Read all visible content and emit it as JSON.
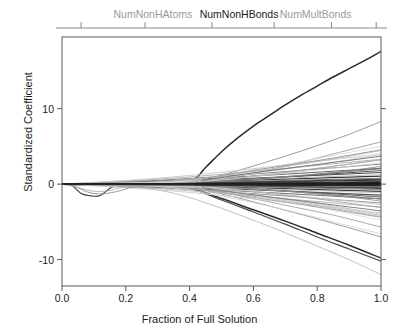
{
  "chart_data": {
    "type": "line",
    "title": "",
    "xlabel": "Fraction of Full Solution",
    "ylabel": "Standardized Coefficient",
    "xlim": [
      0.0,
      1.0
    ],
    "ylim": [
      -13.5,
      19.5
    ],
    "xticks": [
      "0.0",
      "0.2",
      "0.4",
      "0.6",
      "0.8",
      "1.0"
    ],
    "xtick_values": [
      0.0,
      0.2,
      0.4,
      0.6,
      0.8,
      1.0
    ],
    "yticks": [
      "10",
      "0",
      "-10"
    ],
    "ytick_values": [
      10,
      0,
      -10
    ],
    "grid": false,
    "legend": "none",
    "top_axis_labels": [
      {
        "text": "NumNonHAtoms",
        "x": 0.285,
        "emphasis": "grey"
      },
      {
        "text": "NumNonHBonds",
        "x": 0.555,
        "emphasis": "black"
      },
      {
        "text": "NumMultBonds",
        "x": 0.795,
        "emphasis": "grey"
      }
    ],
    "top_axis_tick_values": [
      0.06,
      0.26,
      0.47,
      0.665,
      0.845,
      0.985
    ],
    "series": [
      {
        "name": "rise-major",
        "shade": "#2b2b2b",
        "width": 1.5,
        "x": [
          0.0,
          0.1,
          0.2,
          0.3,
          0.4,
          0.45,
          0.5,
          0.55,
          0.6,
          0.65,
          0.7,
          0.75,
          0.8,
          0.85,
          0.9,
          0.95,
          1.0
        ],
        "y": [
          0.0,
          0.05,
          0.1,
          0.15,
          0.2,
          2.2,
          4.3,
          6.1,
          7.7,
          9.1,
          10.5,
          11.8,
          13.0,
          14.2,
          15.3,
          16.4,
          17.6
        ]
      },
      {
        "name": "fall-major",
        "shade": "#2b2b2b",
        "width": 1.5,
        "x": [
          0.0,
          0.1,
          0.2,
          0.3,
          0.4,
          0.5,
          0.6,
          0.7,
          0.8,
          0.9,
          1.0
        ],
        "y": [
          0.0,
          -0.1,
          -0.2,
          -0.3,
          -0.5,
          -1.9,
          -3.4,
          -4.9,
          -6.5,
          -8.1,
          -9.8
        ]
      },
      {
        "name": "fall-second",
        "shade": "#4a4a4a",
        "width": 1.2,
        "x": [
          0.0,
          0.15,
          0.3,
          0.4,
          0.5,
          0.6,
          0.7,
          0.8,
          0.9,
          1.0
        ],
        "y": [
          0.0,
          -0.2,
          -0.4,
          -0.6,
          -2.1,
          -3.7,
          -5.3,
          -7.0,
          -8.6,
          -10.2
        ]
      },
      {
        "name": "dip-line",
        "shade": "#3a3a3a",
        "width": 1.1,
        "x": [
          0.0,
          0.03,
          0.06,
          0.09,
          0.12,
          0.16,
          0.22,
          0.35,
          0.5,
          0.7,
          0.85,
          1.0
        ],
        "y": [
          0.0,
          -0.15,
          -1.25,
          -1.55,
          -1.5,
          -0.35,
          -0.1,
          0.05,
          0.15,
          0.25,
          0.3,
          0.35
        ]
      },
      {
        "name": "rise-mid-a",
        "shade": "#9e9e9e",
        "width": 1.0,
        "x": [
          0.0,
          0.2,
          0.4,
          0.5,
          0.6,
          0.7,
          0.8,
          0.9,
          1.0
        ],
        "y": [
          0.0,
          0.1,
          0.3,
          1.2,
          2.4,
          3.7,
          5.1,
          6.6,
          8.3
        ]
      },
      {
        "name": "rise-mid-b",
        "shade": "#a8a8a8",
        "width": 1.0,
        "x": [
          0.0,
          0.25,
          0.45,
          0.55,
          0.65,
          0.75,
          0.85,
          1.0
        ],
        "y": [
          0.0,
          0.1,
          0.4,
          1.0,
          1.9,
          2.9,
          4.0,
          5.6
        ]
      },
      {
        "name": "rise-small-a",
        "shade": "#b4b4b4",
        "width": 0.9,
        "x": [
          0.0,
          0.3,
          0.5,
          0.65,
          0.8,
          1.0
        ],
        "y": [
          0.0,
          0.15,
          0.6,
          1.3,
          2.1,
          3.2
        ]
      },
      {
        "name": "fall-mid-a",
        "shade": "#9e9e9e",
        "width": 1.0,
        "x": [
          0.0,
          0.2,
          0.38,
          0.5,
          0.65,
          0.8,
          1.0
        ],
        "y": [
          0.0,
          -0.1,
          -0.4,
          -1.3,
          -2.9,
          -4.6,
          -7.0
        ]
      },
      {
        "name": "fall-mid-b",
        "shade": "#ababab",
        "width": 1.0,
        "x": [
          0.0,
          0.25,
          0.42,
          0.55,
          0.7,
          0.85,
          1.0
        ],
        "y": [
          0.0,
          -0.1,
          -0.5,
          -1.5,
          -2.8,
          -4.1,
          -5.7
        ]
      },
      {
        "name": "fall-small-a",
        "shade": "#bcbcbc",
        "width": 0.9,
        "x": [
          0.0,
          0.3,
          0.5,
          0.7,
          0.85,
          1.0
        ],
        "y": [
          0.0,
          -0.2,
          -0.9,
          -2.0,
          -2.9,
          -4.0
        ]
      },
      {
        "name": "fall-steep-grey",
        "shade": "#c2c2c2",
        "width": 1.0,
        "x": [
          0.0,
          0.2,
          0.35,
          0.5,
          0.65,
          0.8,
          0.92,
          1.0
        ],
        "y": [
          0.0,
          -0.3,
          -1.2,
          -3.2,
          -5.6,
          -8.2,
          -10.4,
          -12.0
        ]
      },
      {
        "name": "band-001",
        "shade": "#1f1f1f",
        "width": 1.4,
        "x": [
          0.0,
          0.4,
          1.0
        ],
        "y": [
          0.0,
          0.15,
          0.55
        ]
      },
      {
        "name": "band-002",
        "shade": "#262626",
        "width": 1.4,
        "x": [
          0.0,
          0.4,
          1.0
        ],
        "y": [
          0.0,
          -0.1,
          -0.45
        ]
      },
      {
        "name": "band-003",
        "shade": "#333333",
        "width": 1.2,
        "x": [
          0.0,
          0.4,
          1.0
        ],
        "y": [
          0.0,
          0.3,
          1.05
        ]
      },
      {
        "name": "band-004",
        "shade": "#3d3d3d",
        "width": 1.2,
        "x": [
          0.0,
          0.4,
          1.0
        ],
        "y": [
          0.0,
          -0.28,
          -0.95
        ]
      },
      {
        "name": "band-005",
        "shade": "#4a4a4a",
        "width": 1.1,
        "x": [
          0.0,
          0.4,
          1.0
        ],
        "y": [
          0.0,
          0.45,
          1.55
        ]
      },
      {
        "name": "band-006",
        "shade": "#555555",
        "width": 1.1,
        "x": [
          0.0,
          0.4,
          1.0
        ],
        "y": [
          0.0,
          -0.42,
          -1.45
        ]
      },
      {
        "name": "band-007",
        "shade": "#606060",
        "width": 1.0,
        "x": [
          0.0,
          0.4,
          1.0
        ],
        "y": [
          0.0,
          0.6,
          2.1
        ]
      },
      {
        "name": "band-008",
        "shade": "#6b6b6b",
        "width": 1.0,
        "x": [
          0.0,
          0.4,
          1.0
        ],
        "y": [
          0.0,
          -0.58,
          -1.95
        ]
      },
      {
        "name": "band-009",
        "shade": "#767676",
        "width": 1.0,
        "x": [
          0.0,
          0.4,
          1.0
        ],
        "y": [
          0.0,
          0.22,
          0.78
        ]
      },
      {
        "name": "band-010",
        "shade": "#808080",
        "width": 1.0,
        "x": [
          0.0,
          0.4,
          1.0
        ],
        "y": [
          0.0,
          -0.2,
          -0.72
        ]
      },
      {
        "name": "band-011",
        "shade": "#8a8a8a",
        "width": 1.0,
        "x": [
          0.0,
          0.4,
          1.0
        ],
        "y": [
          0.0,
          0.75,
          2.65
        ]
      },
      {
        "name": "band-012",
        "shade": "#949494",
        "width": 1.0,
        "x": [
          0.0,
          0.4,
          1.0
        ],
        "y": [
          0.0,
          -0.7,
          -2.5
        ]
      },
      {
        "name": "band-013",
        "shade": "#9e9e9e",
        "width": 0.9,
        "x": [
          0.0,
          0.4,
          1.0
        ],
        "y": [
          0.0,
          0.12,
          0.4
        ]
      },
      {
        "name": "band-014",
        "shade": "#a5a5a5",
        "width": 0.9,
        "x": [
          0.0,
          0.4,
          1.0
        ],
        "y": [
          0.0,
          -0.12,
          -0.38
        ]
      },
      {
        "name": "band-015",
        "shade": "#adadad",
        "width": 0.9,
        "x": [
          0.0,
          0.4,
          1.0
        ],
        "y": [
          0.0,
          0.95,
          3.3
        ]
      },
      {
        "name": "band-016",
        "shade": "#b4b4b4",
        "width": 0.9,
        "x": [
          0.0,
          0.4,
          1.0
        ],
        "y": [
          0.0,
          -0.88,
          -3.05
        ]
      },
      {
        "name": "band-017",
        "shade": "#bababa",
        "width": 0.9,
        "x": [
          0.0,
          0.4,
          1.0
        ],
        "y": [
          0.0,
          0.35,
          1.25
        ]
      },
      {
        "name": "band-018",
        "shade": "#c0c0c0",
        "width": 0.9,
        "x": [
          0.0,
          0.4,
          1.0
        ],
        "y": [
          0.0,
          -0.33,
          -1.15
        ]
      },
      {
        "name": "band-019",
        "shade": "#c6c6c6",
        "width": 0.9,
        "x": [
          0.0,
          0.4,
          1.0
        ],
        "y": [
          0.0,
          1.15,
          4.0
        ]
      },
      {
        "name": "band-020",
        "shade": "#cccccc",
        "width": 0.9,
        "x": [
          0.0,
          0.4,
          1.0
        ],
        "y": [
          0.0,
          -1.1,
          -3.8
        ]
      },
      {
        "name": "band-021",
        "shade": "#555555",
        "width": 1.0,
        "x": [
          0.0,
          0.25,
          0.45,
          0.7,
          1.0
        ],
        "y": [
          0.0,
          0.05,
          0.35,
          0.95,
          1.8
        ]
      },
      {
        "name": "band-022",
        "shade": "#5f5f5f",
        "width": 1.0,
        "x": [
          0.0,
          0.25,
          0.45,
          0.7,
          1.0
        ],
        "y": [
          0.0,
          -0.05,
          -0.32,
          -0.9,
          -1.7
        ]
      },
      {
        "name": "band-023",
        "shade": "#707070",
        "width": 1.0,
        "x": [
          0.0,
          0.3,
          0.55,
          0.8,
          1.0
        ],
        "y": [
          0.0,
          0.1,
          0.55,
          1.3,
          2.05
        ]
      },
      {
        "name": "band-024",
        "shade": "#7b7b7b",
        "width": 1.0,
        "x": [
          0.0,
          0.3,
          0.55,
          0.8,
          1.0
        ],
        "y": [
          0.0,
          -0.1,
          -0.52,
          -1.25,
          -1.98
        ]
      },
      {
        "name": "band-025",
        "shade": "#888888",
        "width": 0.9,
        "x": [
          0.0,
          0.35,
          0.6,
          0.85,
          1.0
        ],
        "y": [
          0.0,
          0.18,
          0.7,
          1.55,
          2.35
        ]
      },
      {
        "name": "band-026",
        "shade": "#939393",
        "width": 0.9,
        "x": [
          0.0,
          0.35,
          0.6,
          0.85,
          1.0
        ],
        "y": [
          0.0,
          -0.17,
          -0.66,
          -1.48,
          -2.25
        ]
      },
      {
        "name": "band-027",
        "shade": "#2e2e2e",
        "width": 1.3,
        "x": [
          0.0,
          0.5,
          1.0
        ],
        "y": [
          0.0,
          0.08,
          0.28
        ]
      },
      {
        "name": "band-028",
        "shade": "#343434",
        "width": 1.3,
        "x": [
          0.0,
          0.5,
          1.0
        ],
        "y": [
          0.0,
          -0.06,
          -0.22
        ]
      },
      {
        "name": "band-029",
        "shade": "#424242",
        "width": 1.2,
        "x": [
          0.0,
          0.5,
          1.0
        ],
        "y": [
          0.0,
          0.18,
          0.62
        ]
      },
      {
        "name": "band-030",
        "shade": "#4d4d4d",
        "width": 1.2,
        "x": [
          0.0,
          0.5,
          1.0
        ],
        "y": [
          0.0,
          -0.16,
          -0.58
        ]
      },
      {
        "name": "band-031",
        "shade": "#a0a0a0",
        "width": 0.9,
        "x": [
          0.0,
          0.2,
          0.45,
          0.75,
          1.0
        ],
        "y": [
          0.0,
          -0.05,
          -0.45,
          -1.7,
          -3.1
        ]
      },
      {
        "name": "band-032",
        "shade": "#aaaaaa",
        "width": 0.9,
        "x": [
          0.0,
          0.2,
          0.45,
          0.75,
          1.0
        ],
        "y": [
          0.0,
          0.06,
          0.48,
          1.8,
          3.25
        ]
      },
      {
        "name": "band-033",
        "shade": "#b6b6b6",
        "width": 0.9,
        "x": [
          0.0,
          0.15,
          0.4,
          0.7,
          1.0
        ],
        "y": [
          0.0,
          -0.08,
          -0.6,
          -2.2,
          -4.3
        ]
      },
      {
        "name": "band-034",
        "shade": "#c0c0c0",
        "width": 0.9,
        "x": [
          0.0,
          0.15,
          0.4,
          0.7,
          1.0
        ],
        "y": [
          0.0,
          0.08,
          0.62,
          2.3,
          4.45
        ]
      },
      {
        "name": "band-035",
        "shade": "#cacaca",
        "width": 0.85,
        "x": [
          0.0,
          0.4,
          0.7,
          1.0
        ],
        "y": [
          0.0,
          -0.25,
          -1.4,
          -2.7
        ]
      },
      {
        "name": "band-036",
        "shade": "#d0d0d0",
        "width": 0.85,
        "x": [
          0.0,
          0.4,
          0.7,
          1.0
        ],
        "y": [
          0.0,
          0.26,
          1.45,
          2.8
        ]
      },
      {
        "name": "dip-grey-a",
        "shade": "#8e8e8e",
        "width": 0.9,
        "x": [
          0.0,
          0.04,
          0.08,
          0.12,
          0.17,
          0.25,
          0.45,
          0.7,
          1.0
        ],
        "y": [
          0.0,
          -0.3,
          -1.05,
          -1.3,
          -1.0,
          -0.25,
          0.0,
          0.1,
          0.2
        ]
      },
      {
        "name": "dip-grey-b",
        "shade": "#b0b0b0",
        "width": 0.85,
        "x": [
          0.0,
          0.05,
          0.1,
          0.15,
          0.2,
          0.35,
          0.6,
          1.0
        ],
        "y": [
          0.0,
          -0.45,
          -0.95,
          -0.85,
          -0.4,
          -0.05,
          0.05,
          0.12
        ]
      },
      {
        "name": "grey-fan-a",
        "shade": "#d4d4d4",
        "width": 0.85,
        "x": [
          0.0,
          0.3,
          0.5,
          0.7,
          0.85,
          1.0
        ],
        "y": [
          0.0,
          -0.3,
          -1.6,
          -3.4,
          -5.0,
          -6.6
        ]
      },
      {
        "name": "grey-fan-b",
        "shade": "#d8d8d8",
        "width": 0.85,
        "x": [
          0.0,
          0.35,
          0.55,
          0.75,
          1.0
        ],
        "y": [
          0.0,
          0.3,
          1.5,
          3.0,
          5.0
        ]
      },
      {
        "name": "grey-fan-c",
        "shade": "#dcdcdc",
        "width": 0.85,
        "x": [
          0.0,
          0.45,
          0.65,
          0.85,
          1.0
        ],
        "y": [
          0.0,
          -0.5,
          -1.9,
          -3.5,
          -4.8
        ]
      },
      {
        "name": "grey-fan-d",
        "shade": "#cfcfcf",
        "width": 0.85,
        "x": [
          0.0,
          0.4,
          0.6,
          0.8,
          1.0
        ],
        "y": [
          0.0,
          0.4,
          1.4,
          2.6,
          3.9
        ]
      },
      {
        "name": "grey-fan-e",
        "shade": "#c4c4c4",
        "width": 0.85,
        "x": [
          0.0,
          0.42,
          0.62,
          0.82,
          1.0
        ],
        "y": [
          0.0,
          -0.45,
          -1.55,
          -2.85,
          -4.15
        ]
      },
      {
        "name": "branch-up-a",
        "shade": "#777777",
        "width": 1.0,
        "x": [
          0.0,
          0.4,
          0.45,
          0.6,
          0.8,
          1.0
        ],
        "y": [
          0.0,
          0.1,
          0.55,
          1.5,
          2.6,
          3.7
        ]
      },
      {
        "name": "branch-dn-a",
        "shade": "#7f7f7f",
        "width": 1.0,
        "x": [
          0.0,
          0.4,
          0.45,
          0.6,
          0.8,
          1.0
        ],
        "y": [
          0.0,
          -0.1,
          -0.52,
          -1.42,
          -2.48,
          -3.55
        ]
      },
      {
        "name": "branch-up-b",
        "shade": "#999999",
        "width": 0.95,
        "x": [
          0.0,
          0.38,
          0.44,
          0.62,
          0.82,
          1.0
        ],
        "y": [
          0.0,
          0.12,
          0.7,
          1.95,
          3.25,
          4.55
        ]
      },
      {
        "name": "branch-dn-b",
        "shade": "#a2a2a2",
        "width": 0.95,
        "x": [
          0.0,
          0.38,
          0.44,
          0.62,
          0.82,
          1.0
        ],
        "y": [
          0.0,
          -0.12,
          -0.68,
          -1.88,
          -3.15,
          -4.4
        ]
      },
      {
        "name": "near-zero-a",
        "shade": "#141414",
        "width": 1.6,
        "x": [
          0.0,
          1.0
        ],
        "y": [
          0.0,
          0.05
        ]
      },
      {
        "name": "near-zero-b",
        "shade": "#181818",
        "width": 1.6,
        "x": [
          0.0,
          1.0
        ],
        "y": [
          0.0,
          -0.05
        ]
      },
      {
        "name": "near-zero-c",
        "shade": "#202020",
        "width": 1.5,
        "x": [
          0.0,
          1.0
        ],
        "y": [
          0.0,
          0.18
        ]
      },
      {
        "name": "near-zero-d",
        "shade": "#242424",
        "width": 1.5,
        "x": [
          0.0,
          1.0
        ],
        "y": [
          0.0,
          -0.16
        ]
      }
    ]
  },
  "axes": {
    "plot_left_px": 62,
    "plot_right_px": 381,
    "plot_top_px": 37,
    "plot_bottom_px": 286
  }
}
